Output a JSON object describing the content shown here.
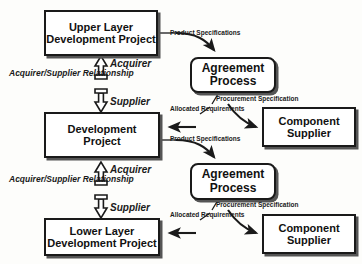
{
  "diagram": {
    "colors": {
      "background": "#fdfdfb",
      "stroke": "#1a1a1a",
      "shadow": "#555555",
      "text": "#111111"
    },
    "nodes": [
      {
        "id": "upper-layer-development-project",
        "line1": "Upper Layer",
        "line2": "Development Project",
        "shape": "rectangle"
      },
      {
        "id": "development-project",
        "line1": "Development",
        "line2": "Project",
        "shape": "rectangle"
      },
      {
        "id": "lower-layer-development-project",
        "line1": "Lower Layer",
        "line2": "Development Project",
        "shape": "rectangle"
      },
      {
        "id": "agreement-process-upper",
        "line1": "Agreement",
        "line2": "Process",
        "shape": "rounded-rectangle"
      },
      {
        "id": "agreement-process-lower",
        "line1": "Agreement",
        "line2": "Process",
        "shape": "rounded-rectangle"
      },
      {
        "id": "component-supplier-upper",
        "line1": "Component",
        "line2": "Supplier",
        "shape": "rectangle"
      },
      {
        "id": "component-supplier-lower",
        "line1": "Component",
        "line2": "Supplier",
        "shape": "rectangle"
      }
    ],
    "edge_labels": {
      "product_specifications_upper": "Product Specifications",
      "product_specifications_lower": "Product Specifications",
      "procurement_specification_upper_l1": "Procurement",
      "procurement_specification_upper_l2": "Specification",
      "procurement_specification_lower_l1": "Procurement",
      "procurement_specification_lower_l2": "Specification",
      "allocated_requirements_upper_l1": "Allocated",
      "allocated_requirements_upper_l2": "Requirements",
      "allocated_requirements_lower_l1": "Allocated",
      "allocated_requirements_lower_l2": "Requirements",
      "acquirer_upper": "Acquirer",
      "supplier_upper": "Supplier",
      "acquirer_lower": "Acquirer",
      "supplier_lower": "Supplier",
      "relationship_upper_l1": "Acquirer/Supplier",
      "relationship_upper_l2": "Relationship",
      "relationship_lower_l1": "Acquirer/Supplier",
      "relationship_lower_l2": "Relationship"
    }
  }
}
